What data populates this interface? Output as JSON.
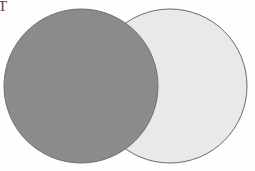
{
  "figure": {
    "type": "venn-two-circle-diagram",
    "background_color": "#fefefe",
    "corner_label": {
      "text": "T",
      "color": "#4a4a4a",
      "note": "partially clipped at left edge of image"
    },
    "circles": [
      {
        "name": "left-circle",
        "fill_color": "#8b8b8b",
        "stroke_color": "#6f6f6f",
        "stroke_width": 1,
        "cx": 81,
        "cy": 86,
        "r": 77,
        "z_order": 2
      },
      {
        "name": "right-circle",
        "fill_color": "#e9e9e9",
        "stroke_color": "#6a6a6a",
        "stroke_width": 1,
        "cx": 170,
        "cy": 86,
        "r": 77,
        "z_order": 1
      }
    ]
  },
  "chart_data": {
    "type": "scatter",
    "title": "",
    "xlabel": "",
    "ylabel": "",
    "annotations": [
      "T"
    ],
    "legend": [],
    "grid": false,
    "shapes": [
      {
        "shape": "circle",
        "label": "left-circle",
        "center": [
          81,
          86
        ],
        "radius": 77,
        "fill": "#8b8b8b",
        "stroke": "#6f6f6f"
      },
      {
        "shape": "circle",
        "label": "right-circle",
        "center": [
          170,
          86
        ],
        "radius": 77,
        "fill": "#e9e9e9",
        "stroke": "#6a6a6a"
      }
    ]
  }
}
